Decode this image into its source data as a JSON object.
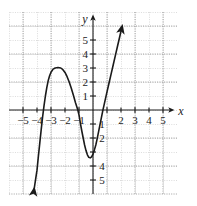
{
  "chart_data": {
    "type": "line",
    "title": "",
    "xlabel": "x",
    "ylabel": "y",
    "xlim": [
      -6.1,
      6.1
    ],
    "ylim": [
      -6.5,
      6.3
    ],
    "grid": true,
    "grid_step": 1,
    "legend": null,
    "axis_labels": {
      "x": "x",
      "y": "y"
    },
    "xticks": [
      -5,
      -4,
      -3,
      -2,
      -1,
      2,
      3,
      4,
      5
    ],
    "xtick_labels": [
      "−5",
      "−4",
      "−3",
      "−2",
      "−1",
      "2",
      "3",
      "4",
      "5"
    ],
    "yticks": [
      5,
      4,
      3,
      2,
      1,
      -1,
      -2,
      -4,
      -5
    ],
    "ytick_labels": [
      "5",
      "4",
      "3",
      "2",
      "1",
      "1",
      "2",
      "4",
      "5"
    ],
    "series": [
      {
        "name": "cubic curve",
        "color": "#1a1a1a",
        "arrow_start": true,
        "arrow_end": true,
        "points": [
          [
            -4.22,
            -5.75
          ],
          [
            -4.1,
            -4.95
          ],
          [
            -4.0,
            -4.3
          ],
          [
            -3.9,
            -3.3
          ],
          [
            -3.8,
            -2.35
          ],
          [
            -3.7,
            -1.4
          ],
          [
            -3.6,
            -0.5
          ],
          [
            -3.5,
            0.3
          ],
          [
            -3.4,
            1.0
          ],
          [
            -3.3,
            1.6
          ],
          [
            -3.2,
            2.1
          ],
          [
            -3.1,
            2.45
          ],
          [
            -3.0,
            2.7
          ],
          [
            -2.85,
            2.92
          ],
          [
            -2.7,
            3.0
          ],
          [
            -2.5,
            3.03
          ],
          [
            -2.3,
            3.0
          ],
          [
            -2.15,
            2.88
          ],
          [
            -2.0,
            2.68
          ],
          [
            -1.85,
            2.38
          ],
          [
            -1.7,
            2.0
          ],
          [
            -1.55,
            1.55
          ],
          [
            -1.4,
            1.05
          ],
          [
            -1.25,
            0.52
          ],
          [
            -1.1,
            0.05
          ],
          [
            -1.0,
            -0.35
          ],
          [
            -0.9,
            -0.95
          ],
          [
            -0.8,
            -1.5
          ],
          [
            -0.7,
            -2.0
          ],
          [
            -0.6,
            -2.5
          ],
          [
            -0.5,
            -2.9
          ],
          [
            -0.4,
            -3.2
          ],
          [
            -0.3,
            -3.38
          ],
          [
            -0.2,
            -3.42
          ],
          [
            -0.1,
            -3.35
          ],
          [
            0.0,
            -3.15
          ],
          [
            0.1,
            -2.85
          ],
          [
            0.2,
            -2.5
          ],
          [
            0.3,
            -2.05
          ],
          [
            0.4,
            -1.55
          ],
          [
            0.5,
            -1.05
          ],
          [
            0.6,
            -0.55
          ],
          [
            0.7,
            -0.05
          ],
          [
            0.8,
            0.4
          ],
          [
            0.9,
            0.85
          ],
          [
            1.0,
            1.3
          ],
          [
            1.15,
            1.95
          ],
          [
            1.3,
            2.6
          ],
          [
            1.45,
            3.25
          ],
          [
            1.6,
            3.9
          ],
          [
            1.75,
            4.55
          ],
          [
            1.9,
            5.2
          ],
          [
            2.05,
            5.85
          ]
        ],
        "local_max": [
          -2.4,
          3.0
        ],
        "local_min": [
          -0.25,
          -3.4
        ],
        "x_intercepts": [
          -3.58,
          -1.08,
          0.71
        ]
      }
    ]
  }
}
